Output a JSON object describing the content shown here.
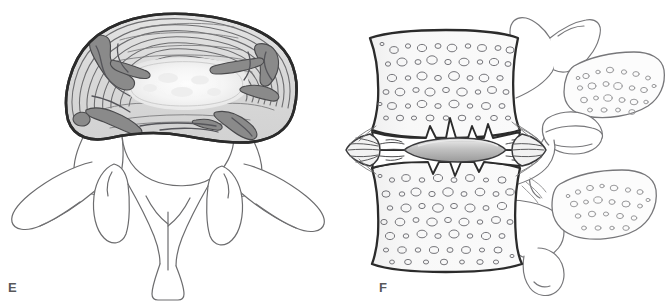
{
  "figure": {
    "background_color": "#ffffff",
    "width": 668,
    "height": 302,
    "panel_count": 2
  },
  "panels": [
    {
      "id": "E",
      "label": "E",
      "view": "superior-axial-view-lumbar-vertebra",
      "description": "Superior (axial) view of a lumbar vertebra showing a degenerated intervertebral disc with concentric annulus fibrosus lamellae, a pale central nucleus pulposus, and dark radial annular fissures, together with the vertebral arch, pedicles, superior articular processes, transverse processes and spinous process.",
      "structures": [
        "annulus-fibrosus",
        "nucleus-pulposus",
        "radial-annular-fissure",
        "vertebral-body",
        "pedicle",
        "superior-articular-process",
        "transverse-process",
        "lamina",
        "spinous-process",
        "vertebral-foramen"
      ]
    },
    {
      "id": "F",
      "label": "F",
      "view": "lateral-sagittal-view-motion-segment",
      "description": "Lateral (sagittal) view of a lumbar motion segment showing two vertebral bodies with trabecular bone, a severely narrowed degenerated disc space with a flattened grey nucleus pulposus, irregular sclerotic endplates, anterior and posterior osteophytes, the facet joint and two spinous processes shown in cut section with trabecular bone.",
      "structures": [
        "vertebral-body-superior",
        "vertebral-body-inferior",
        "trabecular-bone",
        "degenerated-intervertebral-disc",
        "nucleus-pulposus",
        "annulus-fibrosus-fibers",
        "endplate-irregularity",
        "anterior-osteophyte",
        "posterior-osteophyte",
        "pedicle",
        "facet-joint",
        "superior-articular-process",
        "inferior-articular-process",
        "spinous-process-superior",
        "spinous-process-inferior"
      ]
    }
  ],
  "colors": {
    "outline_dark": "#2b2b2b",
    "outline_medium": "#58585a",
    "outline_light": "#7c7c7e",
    "annulus_fill": "#dcdcdc",
    "annulus_fill_light": "#e8e8e8",
    "fissure_gray": "#8a8a8a",
    "fissure_gray_dark": "#757577",
    "nucleus_pale": "#f7f7f7",
    "nucleus_gray": "#a9a9a9",
    "nucleus_gray_light": "#d5d5d5",
    "bone_fill": "#f4f4f4",
    "background": "#ffffff",
    "label_color": "#58585a"
  }
}
